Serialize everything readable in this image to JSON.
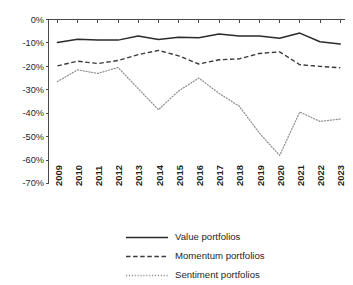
{
  "chart_data": {
    "type": "line",
    "title": "",
    "subtitle": "",
    "xlabel": "",
    "ylabel": "",
    "categories": [
      "2009",
      "2010",
      "2011",
      "2012",
      "2013",
      "2014",
      "2015",
      "2016",
      "2017",
      "2018",
      "2019",
      "2020",
      "2021",
      "2022",
      "2023"
    ],
    "x": [
      2009,
      2010,
      2011,
      2012,
      2013,
      2014,
      2015,
      2016,
      2017,
      2018,
      2019,
      2020,
      2021,
      2022,
      2023
    ],
    "ylim": [
      -70,
      0
    ],
    "ytick_values": [
      0,
      -10,
      -20,
      -30,
      -40,
      -50,
      -60,
      -70
    ],
    "ytick_labels": [
      "0%",
      "-10%",
      "-20%",
      "-30%",
      "-40%",
      "-50%",
      "-60%",
      "-70%"
    ],
    "grid": false,
    "legend_position": "below",
    "series": [
      {
        "name": "Value portfolios",
        "style": "solid",
        "color": "#2b2b2b",
        "values": [
          -9.8,
          -8.4,
          -8.7,
          -8.8,
          -7.0,
          -8.5,
          -7.6,
          -7.8,
          -6.2,
          -7.0,
          -7.0,
          -8.0,
          -5.8,
          -9.5,
          -10.5
        ]
      },
      {
        "name": "Momentum portfolios",
        "style": "dashed",
        "color": "#3a3a3a",
        "values": [
          -19.8,
          -17.8,
          -18.8,
          -17.5,
          -15.0,
          -13.2,
          -15.5,
          -19.0,
          -17.2,
          -16.8,
          -14.5,
          -13.8,
          -19.3,
          -20.0,
          -20.6
        ]
      },
      {
        "name": "Sentiment portfolios",
        "style": "dotted",
        "color": "#8c8c8c",
        "values": [
          -26.5,
          -21.5,
          -23.0,
          -20.5,
          -29.5,
          -38.5,
          -30.5,
          -25.0,
          -31.5,
          -37.0,
          -48.5,
          -58.0,
          -39.5,
          -43.5,
          -42.5
        ]
      }
    ]
  },
  "legend": {
    "items": [
      {
        "label": "Value portfolios"
      },
      {
        "label": "Momentum portfolios"
      },
      {
        "label": "Sentiment portfolios"
      }
    ]
  }
}
